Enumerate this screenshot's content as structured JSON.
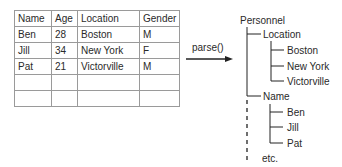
{
  "table": {
    "headers": [
      "Name",
      "Age",
      "Location",
      "Gender"
    ],
    "rows": [
      [
        "Ben",
        "28",
        "Boston",
        "M"
      ],
      [
        "Jill",
        "34",
        "New York",
        "F"
      ],
      [
        "Pat",
        "21",
        "Victorville",
        "M"
      ],
      [
        "",
        "",
        "",
        ""
      ],
      [
        "",
        "",
        "",
        ""
      ]
    ]
  },
  "arrow": {
    "label": "parse()"
  },
  "tree": {
    "root": "Personnel",
    "groups": [
      {
        "label": "Location",
        "children": [
          "Boston",
          "New York",
          "Victorville"
        ]
      },
      {
        "label": "Name",
        "children": [
          "Ben",
          "Jill",
          "Pat"
        ]
      }
    ],
    "more": "etc."
  }
}
